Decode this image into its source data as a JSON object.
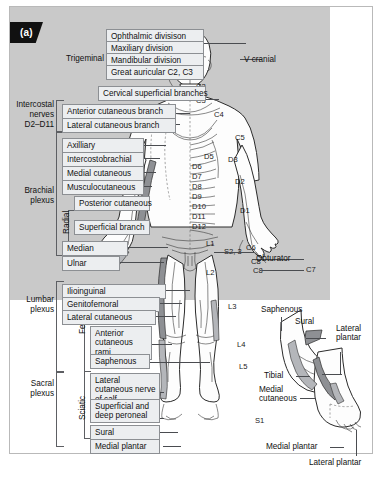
{
  "figure": {
    "panel_label": "(a)",
    "background_color": "#c9c9c9",
    "frame_color": "#b9b9b9",
    "shade_color": "#8e9094"
  },
  "groups": {
    "trigeminal": "Trigeminal",
    "intercostal": "Intercostal\nnerves\nD2–D11",
    "intercostal_l1": "Intercostal",
    "intercostal_l2": "nerves",
    "intercostal_l3": "D2–D11",
    "brachial_l1": "Brachial",
    "brachial_l2": "plexus",
    "radial": "Radial",
    "lumbar_l1": "Lumbar",
    "lumbar_l2": "plexus",
    "femoral": "Femoral",
    "sacral_l1": "Sacral",
    "sacral_l2": "plexus",
    "sciatic": "Sciatic"
  },
  "labels": {
    "ophthalmic": "Ophthalmic divisison",
    "maxillary": "Maxiliary division",
    "mandibular": "Mandibular division",
    "great_auricular": "Great auricular C2, C3",
    "cervical_superficial": "Cervical superficial branches",
    "v_cranial": "V cranial",
    "anterior_cutaneous_branch": "Anterior cutaneous branch",
    "lateral_cutaneous_branch": "Lateral cutaneous branch",
    "axillary": "Axilliary",
    "intercostobrachial": "Intercostobrachial",
    "medial_cutaneous": "Medial cutaneous",
    "musculocutaneous": "Musculocutaneous",
    "posterior_cutaneous": "Posterior cutaneous",
    "superficial_branch": "Superficial branch",
    "median": "Median",
    "ulnar": "Ulnar",
    "ilioinguinal": "Ilioinguinal",
    "genitofemoral": "Genitofemoral",
    "lateral_cutaneous": "Lateral cutaneous",
    "anterior_cutaneous_rami": "Anterior\ncutaneous rami",
    "saphenous": "Saphenous",
    "lateral_cutaneous_nerve_of_calf": "Lateral cutaneous\nnerve of calf",
    "superficial_and_deep_peroneal": "Superficial and deep\nperoneal",
    "sural": "Sural",
    "medial_plantar": "Medial plantar",
    "obturator": "Obturator",
    "foot_saphenous": "Saphenous",
    "foot_sural": "Sural",
    "foot_lateral_plantar": "Lateral\nplantar",
    "foot_tibial": "Tibial",
    "foot_medial_cutaneous": "Medial\ncutaneous",
    "foot_medial_plantar": "Medial plantar",
    "foot_lateral_plantar_bottom": "Lateral plantar"
  },
  "dermatomes": {
    "c2": "C2",
    "c3": "C3",
    "c4": "C4",
    "c5": "C5",
    "c6": "C6",
    "c7": "C7",
    "c8_arm": "C8",
    "c8_hand": "C8",
    "d1": "D1",
    "d2": "D2",
    "d3": "D3",
    "d5": "D5",
    "d6": "D6",
    "d7": "D7",
    "d8": "D8",
    "d9": "D9",
    "d10": "D10",
    "d11": "D11",
    "d12": "D12",
    "l1": "L1",
    "l2": "L2",
    "l3": "L3",
    "l4": "L4",
    "l5": "L5",
    "s1": "S1",
    "s23": "S2, 3"
  }
}
